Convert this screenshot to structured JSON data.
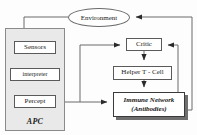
{
  "diagram": {
    "nodes": {
      "environment": {
        "label": "Environment",
        "shape": "ellipse"
      },
      "sensors": {
        "label": "Sensors",
        "shape": "rect"
      },
      "interpreter": {
        "label": "interpreter",
        "shape": "rect"
      },
      "percept": {
        "label": "Percept",
        "shape": "rect"
      },
      "apc": {
        "label": "APC",
        "shape": "container"
      },
      "critic": {
        "label": "Critic",
        "shape": "rect"
      },
      "helper_t_cell": {
        "label": "Helper T - Cell",
        "shape": "rect"
      },
      "immune_network": {
        "line1": "Immune Network",
        "line2": "(Antibodies)",
        "shape": "rect-shadow"
      }
    },
    "edges": [
      {
        "from": "environment",
        "to": "sensors",
        "style": "elbow-left-down"
      },
      {
        "from": "sensors",
        "to": "interpreter",
        "style": "straight-down"
      },
      {
        "from": "interpreter",
        "to": "percept",
        "style": "straight-down"
      },
      {
        "from": "percept",
        "to": "immune_network",
        "style": "straight-right"
      },
      {
        "from": "percept",
        "to": "critic",
        "style": "elbow-up-right"
      },
      {
        "from": "critic",
        "to": "helper_t_cell",
        "style": "straight-down"
      },
      {
        "from": "helper_t_cell",
        "to": "immune_network",
        "style": "straight-down"
      },
      {
        "from": "immune_network",
        "to": "critic",
        "style": "elbow-right-up"
      },
      {
        "from": "immune_network",
        "to": "environment",
        "style": "elbow-right-up-far"
      }
    ],
    "colors": {
      "stroke": "#5a5a5a",
      "node_fill": "#ffffff",
      "container_fill": "#e9e9e9",
      "shadow": "#6f6f6f",
      "text": "#1a1a1a",
      "background": "#ffffff"
    }
  }
}
